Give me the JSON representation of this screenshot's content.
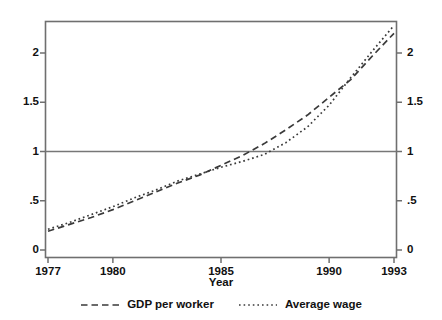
{
  "chart_data": {
    "type": "line",
    "title": "",
    "subtitle": "",
    "xlabel": "Year",
    "ylabel": "",
    "xlim": [
      1977,
      1993
    ],
    "ylim": [
      0,
      2.3
    ],
    "grid": false,
    "legend_position": "bottom",
    "x_tick_labels": [
      "1977",
      "1980",
      "1985",
      "1990",
      "1993"
    ],
    "x_ticks": [
      1977,
      1980,
      1985,
      1990,
      1993
    ],
    "y_tick_labels": [
      "0",
      ".5",
      "1",
      "1.5",
      "2"
    ],
    "y_ticks": [
      0,
      0.5,
      1,
      1.5,
      2
    ],
    "y_axis_mirrored": true,
    "reference_line": {
      "y": 1,
      "style": "solid",
      "color": "#777777"
    },
    "x": [
      1977,
      1978,
      1979,
      1980,
      1981,
      1982,
      1983,
      1984,
      1985,
      1986,
      1987,
      1988,
      1989,
      1990,
      1991,
      1992,
      1993
    ],
    "series": [
      {
        "name": "GDP per worker",
        "style": "dashed",
        "color": "#3a3a3a",
        "values": [
          0.19,
          0.26,
          0.33,
          0.41,
          0.5,
          0.59,
          0.68,
          0.76,
          0.86,
          0.96,
          1.08,
          1.22,
          1.37,
          1.55,
          1.73,
          1.97,
          2.2
        ]
      },
      {
        "name": "Average wage",
        "style": "dotted",
        "color": "#3a3a3a",
        "values": [
          0.21,
          0.28,
          0.36,
          0.44,
          0.53,
          0.61,
          0.7,
          0.77,
          0.84,
          0.9,
          0.97,
          1.09,
          1.25,
          1.47,
          1.75,
          2.02,
          2.28
        ]
      }
    ]
  },
  "axes": {
    "left_ticks": [
      {
        "label": "2",
        "value": 2
      },
      {
        "label": "1.5",
        "value": 1.5
      },
      {
        "label": "1",
        "value": 1
      },
      {
        "label": ".5",
        "value": 0.5
      },
      {
        "label": "0",
        "value": 0
      }
    ],
    "right_ticks": [
      {
        "label": "2",
        "value": 2
      },
      {
        "label": "1.5",
        "value": 1.5
      },
      {
        "label": "1",
        "value": 1
      },
      {
        "label": ".5",
        "value": 0.5
      },
      {
        "label": "0",
        "value": 0
      }
    ],
    "x_ticks": [
      {
        "label": "1977",
        "value": 1977
      },
      {
        "label": "1980",
        "value": 1980
      },
      {
        "label": "1985",
        "value": 1985
      },
      {
        "label": "1990",
        "value": 1990
      },
      {
        "label": "1993",
        "value": 1993
      }
    ],
    "x_title": "Year"
  },
  "legend": {
    "items": [
      {
        "label": "GDP per worker",
        "style": "dashed"
      },
      {
        "label": "Average wage",
        "style": "dotted"
      }
    ]
  },
  "colors": {
    "frame": "#6f6f6f",
    "series": "#3a3a3a",
    "reference": "#7a7a7a",
    "text": "#111111",
    "background": "#ffffff"
  }
}
